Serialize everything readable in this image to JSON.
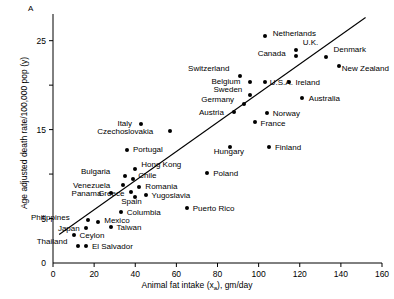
{
  "panel": {
    "label": "A"
  },
  "axes": {
    "xlabel_main": "Animal fat intake (x",
    "xlabel_sub": "a",
    "xlabel_tail": "), gm/day",
    "ylabel": "Age adjusted death rate/100,000 pop (y)",
    "x_ticks": [
      "0",
      "20",
      "40",
      "60",
      "80",
      "100",
      "120",
      "140",
      "160"
    ],
    "y_ticks": [
      "5",
      "15",
      "25"
    ],
    "xlim": [
      0,
      160
    ],
    "ylim": [
      0,
      28
    ]
  },
  "chart_data": {
    "type": "scatter",
    "title": "",
    "xlabel": "Animal fat intake (xa), gm/day",
    "ylabel": "Age adjusted death rate/100,000 pop (y)",
    "xlim": [
      0,
      160
    ],
    "ylim": [
      0,
      28
    ],
    "grid": false,
    "legend": "none",
    "trendline": {
      "x": [
        3,
        152
      ],
      "y": [
        3.2,
        27.6
      ]
    },
    "points": [
      {
        "name": "Netherlands",
        "x": 103,
        "y": 25.5,
        "lx": 8,
        "ly": -4
      },
      {
        "name": "U.K.",
        "x": 118,
        "y": 24.0,
        "lx": 7,
        "ly": -9
      },
      {
        "name": "Canada",
        "x": 118,
        "y": 23.3,
        "lx": -38,
        "ly": -4
      },
      {
        "name": "Denmark",
        "x": 133,
        "y": 23.2,
        "lx": 7,
        "ly": -9
      },
      {
        "name": "New Zealand",
        "x": 139,
        "y": 22.2,
        "lx": 3,
        "ly": 1
      },
      {
        "name": "Switzerland",
        "x": 91,
        "y": 21.0,
        "lx": -52,
        "ly": -9
      },
      {
        "name": "Belgium",
        "x": 96,
        "y": 20.4,
        "lx": -39,
        "ly": -2
      },
      {
        "name": "U.S.A.",
        "x": 103,
        "y": 20.4,
        "lx": 5,
        "ly": -1
      },
      {
        "name": "Ireland",
        "x": 115,
        "y": 20.3,
        "lx": 6,
        "ly": -1
      },
      {
        "name": "Sweden",
        "x": 96,
        "y": 18.9,
        "lx": -37,
        "ly": -7
      },
      {
        "name": "Australia",
        "x": 121,
        "y": 18.6,
        "lx": 7,
        "ly": -1
      },
      {
        "name": "Germany",
        "x": 93,
        "y": 17.9,
        "lx": -43,
        "ly": -6
      },
      {
        "name": "Austria",
        "x": 88,
        "y": 17.0,
        "lx": -35,
        "ly": -1
      },
      {
        "name": "Norway",
        "x": 104,
        "y": 16.9,
        "lx": 6,
        "ly": -1
      },
      {
        "name": "France",
        "x": 98,
        "y": 15.9,
        "lx": 6,
        "ly": 0
      },
      {
        "name": "Italy",
        "x": 43,
        "y": 15.6,
        "lx": -24,
        "ly": -2
      },
      {
        "name": "Czechoslovakia",
        "x": 57,
        "y": 14.8,
        "lx": -73,
        "ly": -1
      },
      {
        "name": "Finland",
        "x": 105,
        "y": 13.1,
        "lx": 6,
        "ly": -1
      },
      {
        "name": "Hungary",
        "x": 86,
        "y": 13.0,
        "lx": -16,
        "ly": 3
      },
      {
        "name": "Portugal",
        "x": 36,
        "y": 12.7,
        "lx": 6,
        "ly": -2
      },
      {
        "name": "Hong Kong",
        "x": 40,
        "y": 10.6,
        "lx": 6,
        "ly": -6
      },
      {
        "name": "Poland",
        "x": 75,
        "y": 10.1,
        "lx": 6,
        "ly": -1
      },
      {
        "name": "Bulgaria",
        "x": 35,
        "y": 9.8,
        "lx": -44,
        "ly": -6
      },
      {
        "name": "Chile",
        "x": 39,
        "y": 9.4,
        "lx": 5,
        "ly": -5
      },
      {
        "name": "Venezuela",
        "x": 34,
        "y": 8.8,
        "lx": -50,
        "ly": -1
      },
      {
        "name": "Romania",
        "x": 42,
        "y": 8.5,
        "lx": 6,
        "ly": -2
      },
      {
        "name": "Greece",
        "x": 38,
        "y": 8.0,
        "lx": -33,
        "ly": 0
      },
      {
        "name": "Yugoslavia",
        "x": 45,
        "y": 7.7,
        "lx": 6,
        "ly": -1
      },
      {
        "name": "Panama",
        "x": 28,
        "y": 7.9,
        "lx": -39,
        "ly": -1
      },
      {
        "name": "Spain",
        "x": 40,
        "y": 7.4,
        "lx": -14,
        "ly": 3
      },
      {
        "name": "Columbia",
        "x": 33,
        "y": 5.7,
        "lx": 6,
        "ly": -1
      },
      {
        "name": "Puerto Rico",
        "x": 65,
        "y": 6.2,
        "lx": 6,
        "ly": -1
      },
      {
        "name": "Philippines",
        "x": 17,
        "y": 4.8,
        "lx": -57,
        "ly": -4
      },
      {
        "name": "Mexico",
        "x": 22,
        "y": 4.6,
        "lx": 6,
        "ly": -3
      },
      {
        "name": "Taiwan",
        "x": 28,
        "y": 4.1,
        "lx": 6,
        "ly": -1
      },
      {
        "name": "Japan",
        "x": 16,
        "y": 3.9,
        "lx": -28,
        "ly": -1
      },
      {
        "name": "Ceylon",
        "x": 10,
        "y": 3.1,
        "lx": 6,
        "ly": -1
      },
      {
        "name": "Thailand",
        "x": 12,
        "y": 1.9,
        "lx": -41,
        "ly": -6
      },
      {
        "name": "El Salvador",
        "x": 16,
        "y": 1.9,
        "lx": 6,
        "ly": -1
      }
    ]
  }
}
